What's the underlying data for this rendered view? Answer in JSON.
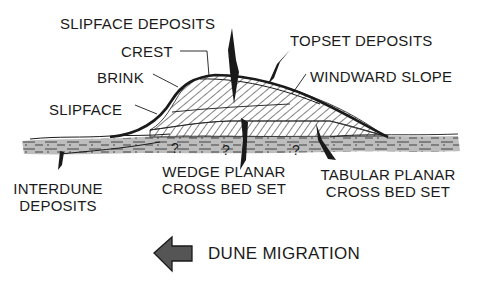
{
  "diagram": {
    "labels": {
      "slipface_deposits": "SLIPFACE DEPOSITS",
      "crest": "CREST",
      "topset_deposits": "TOPSET DEPOSITS",
      "brink": "BRINK",
      "windward_slope": "WINDWARD SLOPE",
      "slipface": "SLIPFACE",
      "wedge_planar_line1": "WEDGE PLANAR",
      "wedge_planar_line2": "CROSS BED SET",
      "tabular_planar_line1": "TABULAR PLANAR",
      "tabular_planar_line2": "CROSS BED SET",
      "interdune_line1": "INTERDUNE",
      "interdune_line2": "DEPOSITS",
      "migration": "DUNE MIGRATION"
    },
    "uncertainty_marks": [
      "?",
      "?",
      "?",
      "?"
    ],
    "migration_direction": "left",
    "colors": {
      "ink": "#1a1a1a",
      "interdune_fill": "#bdbdbd",
      "arrow_fill": "#555555",
      "background": "#ffffff"
    }
  }
}
